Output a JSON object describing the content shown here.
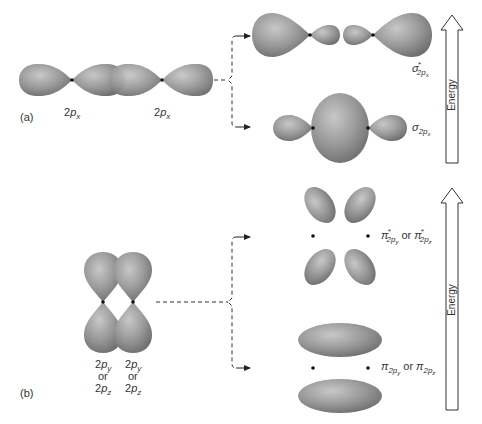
{
  "figure": {
    "panel_a": {
      "panel_label": "(a)",
      "atomic_orbitals": [
        {
          "label_main": "2",
          "label_italic": "p",
          "label_sub": "x"
        },
        {
          "label_main": "2",
          "label_italic": "p",
          "label_sub": "x"
        }
      ],
      "molecular_orbitals": {
        "antibonding": {
          "symbol": "σ",
          "superscript": "*",
          "sub_main": "2",
          "sub_italic": "p",
          "sub_sub": "x"
        },
        "bonding": {
          "symbol": "σ",
          "sub_main": "2",
          "sub_italic": "p",
          "sub_sub": "x"
        }
      },
      "energy_label": "Energy"
    },
    "panel_b": {
      "panel_label": "(b)",
      "atomic_orbitals": [
        {
          "line1": "2py",
          "line2": "or",
          "line3": "2pz"
        },
        {
          "line1": "2py",
          "line2": "or",
          "line3": "2pz"
        }
      ],
      "molecular_orbitals": {
        "antibonding": {
          "symbol": "π",
          "superscript": "*",
          "first_sub": "y",
          "connector": "or",
          "second_sub": "z"
        },
        "bonding": {
          "symbol": "π",
          "first_sub": "y",
          "connector": "or",
          "second_sub": "z"
        }
      },
      "energy_label": "Energy"
    },
    "text": {
      "p": "p",
      "two": "2",
      "x": "x",
      "y": "y",
      "z": "z",
      "or": "or",
      "sigma": "σ",
      "pi": "π",
      "star": "*"
    },
    "colors": {
      "lobe_fill": "#8a8a8a",
      "lobe_highlight": "#c4c4c4",
      "node": "#111111",
      "line": "#333333",
      "background": "#ffffff"
    }
  }
}
